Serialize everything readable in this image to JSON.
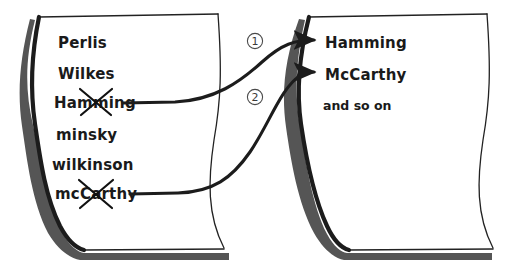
{
  "canvas": {
    "width": 522,
    "height": 279,
    "background": "#ffffff"
  },
  "ink_color": "#1a1a1a",
  "shadow_color": "#4a4a4a",
  "left_page": {
    "name": "left-page",
    "items": [
      {
        "label": "Perlis",
        "struck": false
      },
      {
        "label": "Wilkes",
        "struck": false
      },
      {
        "label": "Hamming",
        "struck": true
      },
      {
        "label": "minsky",
        "struck": false
      },
      {
        "label": "wilkinson",
        "struck": false
      },
      {
        "label": "mcCarthy",
        "struck": true
      }
    ]
  },
  "right_page": {
    "name": "right-page",
    "items": [
      {
        "label": "Hamming",
        "arrow": true
      },
      {
        "label": "McCarthy",
        "arrow": true
      },
      {
        "label": "and so on",
        "arrow": false
      }
    ]
  },
  "arrows": [
    {
      "id": "1",
      "marker": "①",
      "from": "Hamming",
      "to": "Hamming"
    },
    {
      "id": "2",
      "marker": "②",
      "from": "mcCarthy",
      "to": "McCarthy"
    }
  ]
}
